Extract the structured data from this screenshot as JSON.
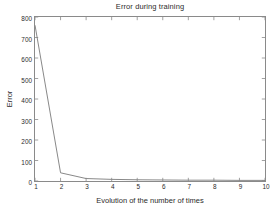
{
  "chart_data": {
    "type": "line",
    "title": "Error during training",
    "xlabel": "Evolution of the number of times",
    "ylabel": "Error",
    "x": [
      1,
      2,
      3,
      4,
      5,
      6,
      7,
      8,
      9,
      10
    ],
    "values": [
      760,
      40,
      12,
      8,
      6,
      5,
      4,
      4,
      3,
      3
    ],
    "series": [
      {
        "name": "Error",
        "values": [
          760,
          40,
          12,
          8,
          6,
          5,
          4,
          4,
          3,
          3
        ]
      }
    ],
    "xlim": [
      1,
      10
    ],
    "ylim": [
      0,
      800
    ],
    "xticks": [
      "1",
      "2",
      "3",
      "4",
      "5",
      "6",
      "7",
      "8",
      "9",
      "10"
    ],
    "yticks": [
      "0",
      "100",
      "200",
      "300",
      "400",
      "500",
      "600",
      "700",
      "800"
    ],
    "xtick_values": [
      1,
      2,
      3,
      4,
      5,
      6,
      7,
      8,
      9,
      10
    ],
    "ytick_values": [
      0,
      100,
      200,
      300,
      400,
      500,
      600,
      700,
      800
    ],
    "grid": false,
    "legend": null,
    "line_color": "#7a7a7a",
    "axis_color": "#8a8a8a",
    "text_color": "#2b2b2b",
    "background_color": "#ffffff"
  }
}
